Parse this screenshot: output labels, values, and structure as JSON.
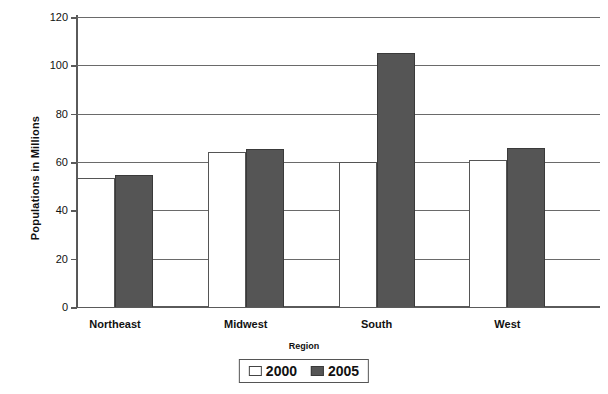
{
  "chart_data": {
    "type": "bar",
    "title": "",
    "xlabel": "Region",
    "ylabel": "Populations in Millions",
    "categories": [
      "Northeast",
      "Midwest",
      "South",
      "West"
    ],
    "series": [
      {
        "name": "2000",
        "color": "#ffffff",
        "values": [
          53.5,
          64,
          60,
          61
        ]
      },
      {
        "name": "2005",
        "color": "#555555",
        "values": [
          54.5,
          65.5,
          105,
          66
        ]
      }
    ],
    "ylim": [
      0,
      120
    ],
    "yticks": [
      0,
      20,
      40,
      60,
      80,
      100,
      120
    ],
    "ytick_labels": [
      "0",
      "20",
      "40",
      "60",
      "80",
      "100",
      "120"
    ],
    "grid": true,
    "legend_position": "bottom",
    "legend_entries": [
      "2000",
      "2005"
    ]
  }
}
